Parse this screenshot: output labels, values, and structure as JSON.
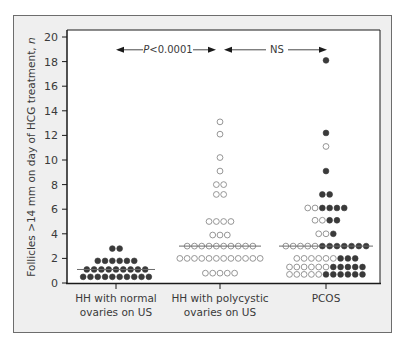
{
  "chart_data": {
    "type": "scatter",
    "subtype": "dot-plot",
    "title": "",
    "xlabel": "",
    "ylabel": "Follicles >14 mm on day of HCG treatment, n",
    "ylabel_italic_suffix": "n",
    "ylabel_main": "Follicles >14 mm on day of HCG treatment, ",
    "ylim": [
      0,
      20
    ],
    "yticks": [
      0,
      2,
      4,
      6,
      8,
      10,
      12,
      14,
      16,
      18,
      20
    ],
    "categories": [
      "HH with normal ovaries on US",
      "HH with polycystic ovaries on US",
      "PCOS"
    ],
    "category_lines": [
      [
        "HH with normal",
        "ovaries on US"
      ],
      [
        "HH with polycystic",
        "ovaries on US"
      ],
      [
        "PCOS"
      ]
    ],
    "legend": [
      {
        "marker": "filled-circle",
        "color": "#3a3a3a"
      },
      {
        "marker": "open-circle",
        "color": "#8a8a8a"
      }
    ],
    "series": [
      {
        "name": "HH with normal ovaries on US",
        "median": 1.1,
        "rows": [
          {
            "y": 0.5,
            "open": 0,
            "filled": 10
          },
          {
            "y": 1.1,
            "open": 0,
            "filled": 9
          },
          {
            "y": 1.8,
            "open": 0,
            "filled": 6
          },
          {
            "y": 2.8,
            "open": 0,
            "filled": 2
          }
        ]
      },
      {
        "name": "HH with polycystic ovaries on US",
        "median": 3.0,
        "rows": [
          {
            "y": 0.8,
            "open": 5,
            "filled": 0
          },
          {
            "y": 2.0,
            "open": 12,
            "filled": 0
          },
          {
            "y": 3.0,
            "open": 10,
            "filled": 0
          },
          {
            "y": 3.9,
            "open": 3,
            "filled": 0
          },
          {
            "y": 5.0,
            "open": 4,
            "filled": 0
          },
          {
            "y": 7.2,
            "open": 2,
            "filled": 0
          },
          {
            "y": 8.0,
            "open": 2,
            "filled": 0
          },
          {
            "y": 9.1,
            "open": 1,
            "filled": 0
          },
          {
            "y": 10.2,
            "open": 1,
            "filled": 0
          },
          {
            "y": 12.1,
            "open": 1,
            "filled": 0
          },
          {
            "y": 13.1,
            "open": 1,
            "filled": 0
          }
        ]
      },
      {
        "name": "PCOS",
        "median": 3.0,
        "rows": [
          {
            "y": 0.7,
            "open": 5,
            "filled": 6
          },
          {
            "y": 1.3,
            "open": 6,
            "filled": 5
          },
          {
            "y": 2.0,
            "open": 6,
            "filled": 3
          },
          {
            "y": 3.0,
            "open": 5,
            "filled": 7
          },
          {
            "y": 4.0,
            "open": 2,
            "filled": 1
          },
          {
            "y": 5.1,
            "open": 2,
            "filled": 2
          },
          {
            "y": 6.1,
            "open": 2,
            "filled": 4
          },
          {
            "y": 7.2,
            "open": 0,
            "filled": 2
          },
          {
            "y": 9.1,
            "open": 0,
            "filled": 1
          },
          {
            "y": 11.1,
            "open": 1,
            "filled": 0
          },
          {
            "y": 12.2,
            "open": 0,
            "filled": 1
          },
          {
            "y": 18.1,
            "open": 0,
            "filled": 1
          }
        ]
      }
    ],
    "annotations": [
      {
        "text": "P<0.0001",
        "italic_prefix": "P",
        "rest": "<0.0001",
        "from": 0,
        "to": 1,
        "y": 19
      },
      {
        "text": "NS",
        "from": 1,
        "to": 2,
        "y": 19
      }
    ],
    "grid": false
  },
  "colors": {
    "frame_bg": "#efefef",
    "plot_bg": "#ffffff",
    "filled_dot": "#3a3a3a",
    "open_dot_stroke": "#8a8a8a",
    "axis": "#1a1a1a",
    "median_line": "#6a6a6a"
  }
}
